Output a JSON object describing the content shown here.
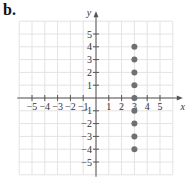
{
  "panel_label": "b.",
  "chart_data": {
    "type": "scatter",
    "title": "",
    "xlabel": "x",
    "ylabel": "y",
    "xlim": [
      -6,
      6
    ],
    "ylim": [
      -6,
      6
    ],
    "grid": true,
    "x_ticks": [
      -5,
      -4,
      -3,
      -2,
      -1,
      1,
      2,
      3,
      4,
      5
    ],
    "y_ticks": [
      -5,
      -4,
      -3,
      -2,
      -1,
      1,
      2,
      3,
      4,
      5
    ],
    "series": [
      {
        "name": "points",
        "color": "#707070",
        "points": [
          {
            "x": 3,
            "y": 4
          },
          {
            "x": 3,
            "y": 3
          },
          {
            "x": 3,
            "y": 2
          },
          {
            "x": 3,
            "y": 1
          },
          {
            "x": 3,
            "y": 0
          },
          {
            "x": 3,
            "y": -1
          },
          {
            "x": 3,
            "y": -2
          },
          {
            "x": 3,
            "y": -3
          },
          {
            "x": 3,
            "y": -4
          }
        ]
      }
    ]
  },
  "colors": {
    "grid": "#e3e3e3",
    "axis": "#555555",
    "point": "#707070"
  }
}
